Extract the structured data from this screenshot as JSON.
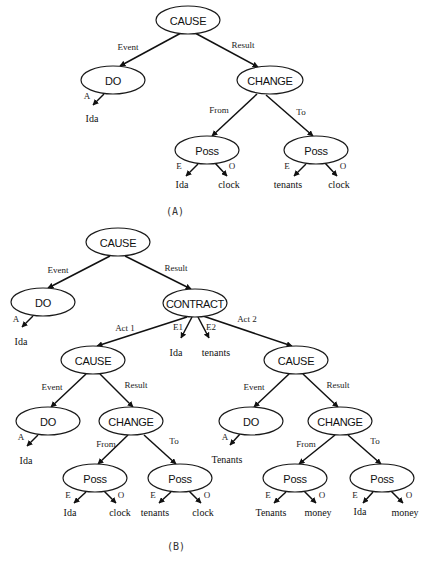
{
  "figure": {
    "width": 423,
    "height": 563,
    "colors": {
      "stroke": "#111111",
      "fill": "#ffffff",
      "text": "#111111"
    },
    "captions": [
      {
        "id": "caption-a",
        "text": "(A)",
        "x": 175,
        "y": 211
      },
      {
        "id": "caption-b",
        "text": "(B)",
        "x": 176,
        "y": 546
      }
    ],
    "nodes": [
      {
        "id": "a-cause",
        "label": "CAUSE",
        "x": 188,
        "y": 20,
        "rx": 32,
        "ry": 14
      },
      {
        "id": "a-do",
        "label": "DO",
        "x": 113,
        "y": 80,
        "rx": 32,
        "ry": 14
      },
      {
        "id": "a-change",
        "label": "CHANGE",
        "x": 270,
        "y": 80,
        "rx": 33,
        "ry": 14
      },
      {
        "id": "a-poss-from",
        "label": "Poss",
        "x": 207,
        "y": 150,
        "rx": 32,
        "ry": 14
      },
      {
        "id": "a-poss-to",
        "label": "Poss",
        "x": 316,
        "y": 150,
        "rx": 32,
        "ry": 14
      },
      {
        "id": "b-cause",
        "label": "CAUSE",
        "x": 118,
        "y": 242,
        "rx": 32,
        "ry": 14
      },
      {
        "id": "b-do",
        "label": "DO",
        "x": 43,
        "y": 302,
        "rx": 32,
        "ry": 14
      },
      {
        "id": "b-contract",
        "label": "CONTRACT",
        "x": 195,
        "y": 303,
        "rx": 32,
        "ry": 14
      },
      {
        "id": "b-cause-1",
        "label": "CAUSE",
        "x": 93,
        "y": 360,
        "rx": 32,
        "ry": 14
      },
      {
        "id": "b-cause-2",
        "label": "CAUSE",
        "x": 296,
        "y": 360,
        "rx": 32,
        "ry": 14
      },
      {
        "id": "b-do-1",
        "label": "DO",
        "x": 48,
        "y": 421,
        "rx": 32,
        "ry": 14
      },
      {
        "id": "b-change-1",
        "label": "CHANGE",
        "x": 131,
        "y": 421,
        "rx": 32,
        "ry": 14
      },
      {
        "id": "b-do-2",
        "label": "DO",
        "x": 251,
        "y": 421,
        "rx": 32,
        "ry": 14
      },
      {
        "id": "b-change-2",
        "label": "CHANGE",
        "x": 340,
        "y": 421,
        "rx": 32,
        "ry": 14
      },
      {
        "id": "b-poss-1-from",
        "label": "Poss",
        "x": 95,
        "y": 478,
        "rx": 32,
        "ry": 14
      },
      {
        "id": "b-poss-1-to",
        "label": "Poss",
        "x": 180,
        "y": 478,
        "rx": 32,
        "ry": 14
      },
      {
        "id": "b-poss-2-from",
        "label": "Poss",
        "x": 295,
        "y": 478,
        "rx": 32,
        "ry": 14
      },
      {
        "id": "b-poss-2-to",
        "label": "Poss",
        "x": 382,
        "y": 478,
        "rx": 32,
        "ry": 14
      }
    ],
    "leaves": [
      {
        "id": "a-leaf-ida-agent",
        "label": "Ida",
        "x": 92,
        "y": 118
      },
      {
        "id": "a-leaf-ida-from",
        "label": "Ida",
        "x": 182,
        "y": 184
      },
      {
        "id": "a-leaf-clock-from",
        "label": "clock",
        "x": 229,
        "y": 184
      },
      {
        "id": "a-leaf-tenants-to",
        "label": "tenants",
        "x": 288,
        "y": 184
      },
      {
        "id": "a-leaf-clock-to",
        "label": "clock",
        "x": 339,
        "y": 184
      },
      {
        "id": "b-leaf-ida-agent",
        "label": "Ida",
        "x": 21,
        "y": 341
      },
      {
        "id": "b-leaf-ida-e1",
        "label": "Ida",
        "x": 176,
        "y": 352
      },
      {
        "id": "b-leaf-tenants-e2",
        "label": "tenants",
        "x": 216,
        "y": 352
      },
      {
        "id": "b-leaf-ida-agent-1",
        "label": "Ida",
        "x": 26,
        "y": 460
      },
      {
        "id": "b-leaf-tenants-agent-2",
        "label": "Tenants",
        "x": 227,
        "y": 459
      },
      {
        "id": "b-leaf-ida-1-from",
        "label": "Ida",
        "x": 70,
        "y": 512
      },
      {
        "id": "b-leaf-clock-1-from",
        "label": "clock",
        "x": 120,
        "y": 512
      },
      {
        "id": "b-leaf-tenants-1-to",
        "label": "tenants",
        "x": 155,
        "y": 512
      },
      {
        "id": "b-leaf-clock-1-to",
        "label": "clock",
        "x": 203,
        "y": 512
      },
      {
        "id": "b-leaf-tenants-2-from",
        "label": "Tenants",
        "x": 271,
        "y": 512
      },
      {
        "id": "b-leaf-money-2-from",
        "label": "money",
        "x": 318,
        "y": 512
      },
      {
        "id": "b-leaf-ida-2-to",
        "label": "Ida",
        "x": 360,
        "y": 511
      },
      {
        "id": "b-leaf-money-2-to",
        "label": "money",
        "x": 405,
        "y": 512
      }
    ],
    "edges": [
      {
        "id": "a-e1",
        "x1": 181,
        "y1": 33,
        "x2": 120,
        "y2": 66,
        "label": "Event",
        "lx": 128,
        "ly": 47
      },
      {
        "id": "a-e2",
        "x1": 195,
        "y1": 33,
        "x2": 258,
        "y2": 67,
        "label": "Result",
        "lx": 243,
        "ly": 45
      },
      {
        "id": "a-e3",
        "x1": 104,
        "y1": 94,
        "x2": 93,
        "y2": 105,
        "label": "A",
        "lx": 87,
        "ly": 96
      },
      {
        "id": "a-e4",
        "x1": 257,
        "y1": 94,
        "x2": 212,
        "y2": 136,
        "label": "From",
        "lx": 219,
        "ly": 110
      },
      {
        "id": "a-e5",
        "x1": 266,
        "y1": 95,
        "x2": 313,
        "y2": 136,
        "label": "To",
        "lx": 301,
        "ly": 112
      },
      {
        "id": "a-e6",
        "x1": 198,
        "y1": 164,
        "x2": 186,
        "y2": 176,
        "label": "E",
        "lx": 179,
        "ly": 166
      },
      {
        "id": "a-e7",
        "x1": 215,
        "y1": 163,
        "x2": 227,
        "y2": 176,
        "label": "O",
        "lx": 232,
        "ly": 166
      },
      {
        "id": "a-e8",
        "x1": 306,
        "y1": 164,
        "x2": 294,
        "y2": 176,
        "label": "E",
        "lx": 287,
        "ly": 166
      },
      {
        "id": "a-e9",
        "x1": 325,
        "y1": 163,
        "x2": 337,
        "y2": 176,
        "label": "O",
        "lx": 343,
        "ly": 166
      },
      {
        "id": "b-e1",
        "x1": 110,
        "y1": 256,
        "x2": 48,
        "y2": 288,
        "label": "Event",
        "lx": 58,
        "ly": 270
      },
      {
        "id": "b-e2",
        "x1": 125,
        "y1": 256,
        "x2": 191,
        "y2": 289,
        "label": "Result",
        "lx": 176,
        "ly": 268
      },
      {
        "id": "b-e3",
        "x1": 33,
        "y1": 316,
        "x2": 22,
        "y2": 327,
        "label": "A",
        "lx": 16,
        "ly": 319
      },
      {
        "id": "b-e4",
        "x1": 187,
        "y1": 317,
        "x2": 97,
        "y2": 346,
        "label": "Act 1",
        "lx": 125,
        "ly": 328
      },
      {
        "id": "b-e5",
        "x1": 192,
        "y1": 317,
        "x2": 181,
        "y2": 338,
        "label": "E1",
        "lx": 178,
        "ly": 327
      },
      {
        "id": "b-e6",
        "x1": 198,
        "y1": 317,
        "x2": 209,
        "y2": 338,
        "label": "E2",
        "lx": 211,
        "ly": 327
      },
      {
        "id": "b-e7",
        "x1": 203,
        "y1": 316,
        "x2": 292,
        "y2": 346,
        "label": "Act 2",
        "lx": 247,
        "ly": 319
      },
      {
        "id": "b-e8",
        "x1": 86,
        "y1": 374,
        "x2": 51,
        "y2": 407,
        "label": "Event",
        "lx": 52,
        "ly": 387
      },
      {
        "id": "b-e9",
        "x1": 100,
        "y1": 374,
        "x2": 133,
        "y2": 407,
        "label": "Result",
        "lx": 136,
        "ly": 385
      },
      {
        "id": "b-e10",
        "x1": 289,
        "y1": 374,
        "x2": 254,
        "y2": 407,
        "label": "Event",
        "lx": 254,
        "ly": 387
      },
      {
        "id": "b-e11",
        "x1": 303,
        "y1": 374,
        "x2": 338,
        "y2": 407,
        "label": "Result",
        "lx": 338,
        "ly": 385
      },
      {
        "id": "b-e12",
        "x1": 38,
        "y1": 435,
        "x2": 27,
        "y2": 446,
        "label": "A",
        "lx": 21,
        "ly": 437
      },
      {
        "id": "b-e13",
        "x1": 128,
        "y1": 435,
        "x2": 98,
        "y2": 464,
        "label": "From",
        "lx": 106,
        "ly": 444
      },
      {
        "id": "b-e14",
        "x1": 144,
        "y1": 435,
        "x2": 176,
        "y2": 464,
        "label": "To",
        "lx": 174,
        "ly": 441
      },
      {
        "id": "b-e15",
        "x1": 240,
        "y1": 434,
        "x2": 230,
        "y2": 445,
        "label": "A",
        "lx": 225,
        "ly": 437
      },
      {
        "id": "b-e16",
        "x1": 335,
        "y1": 435,
        "x2": 299,
        "y2": 464,
        "label": "From",
        "lx": 306,
        "ly": 444
      },
      {
        "id": "b-e17",
        "x1": 348,
        "y1": 435,
        "x2": 381,
        "y2": 464,
        "label": "To",
        "lx": 375,
        "ly": 441
      },
      {
        "id": "b-e18",
        "x1": 86,
        "y1": 492,
        "x2": 74,
        "y2": 503,
        "label": "E",
        "lx": 68,
        "ly": 495
      },
      {
        "id": "b-e19",
        "x1": 104,
        "y1": 491,
        "x2": 116,
        "y2": 503,
        "label": "O",
        "lx": 121,
        "ly": 495
      },
      {
        "id": "b-e20",
        "x1": 171,
        "y1": 492,
        "x2": 159,
        "y2": 503,
        "label": "E",
        "lx": 153,
        "ly": 495
      },
      {
        "id": "b-e21",
        "x1": 189,
        "y1": 491,
        "x2": 201,
        "y2": 503,
        "label": "O",
        "lx": 207,
        "ly": 495
      },
      {
        "id": "b-e22",
        "x1": 286,
        "y1": 492,
        "x2": 274,
        "y2": 503,
        "label": "E",
        "lx": 268,
        "ly": 495
      },
      {
        "id": "b-e23",
        "x1": 304,
        "y1": 491,
        "x2": 316,
        "y2": 503,
        "label": "O",
        "lx": 322,
        "ly": 495
      },
      {
        "id": "b-e24",
        "x1": 373,
        "y1": 492,
        "x2": 363,
        "y2": 503,
        "label": "E",
        "lx": 355,
        "ly": 495
      },
      {
        "id": "b-e25",
        "x1": 391,
        "y1": 491,
        "x2": 403,
        "y2": 503,
        "label": "O",
        "lx": 409,
        "ly": 495
      }
    ]
  }
}
